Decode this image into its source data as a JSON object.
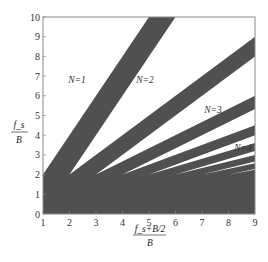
{
  "chart_data": {
    "type": "area",
    "title": "",
    "xlabel": "(f_s + B/2) / B",
    "xlabel_num": "f_s+B/2",
    "xlabel_den": "B",
    "ylabel": "f_s / B",
    "ylabel_num": "f_s",
    "ylabel_den": "B",
    "xlim": [
      1,
      9
    ],
    "ylim": [
      0,
      10
    ],
    "xticks": [
      "1",
      "2",
      "3",
      "4",
      "5",
      "6",
      "7",
      "8",
      "9"
    ],
    "yticks": [
      "0",
      "1",
      "2",
      "3",
      "4",
      "5",
      "6",
      "7",
      "8",
      "9",
      "10"
    ],
    "grid": false,
    "legend": "none",
    "zones": [
      {
        "N": 1,
        "label": "N=1",
        "apex": [
          1,
          2
        ],
        "lower_slope": 2.0,
        "upper": "none"
      },
      {
        "N": 2,
        "label": "N=2",
        "apex": [
          2,
          2
        ],
        "lower_slope": 1.0,
        "upper_slope": 2.0
      },
      {
        "N": 3,
        "label": "N=3",
        "apex": [
          3,
          2
        ],
        "lower_slope": 0.667,
        "upper_slope": 1.0
      },
      {
        "N": 4,
        "label": "N=4",
        "apex": [
          4,
          2
        ],
        "lower_slope": 0.5,
        "upper_slope": 0.667
      },
      {
        "N": 5,
        "label": "",
        "apex": [
          5,
          2
        ],
        "lower_slope": 0.4,
        "upper_slope": 0.5
      },
      {
        "N": 6,
        "label": "",
        "apex": [
          6,
          2
        ],
        "lower_slope": 0.333,
        "upper_slope": 0.4
      },
      {
        "N": 7,
        "label": "",
        "apex": [
          7,
          2
        ],
        "lower_slope": 0.286,
        "upper_slope": 0.333
      },
      {
        "N": 8,
        "label": "",
        "apex": [
          8,
          2
        ],
        "lower_slope": 0.25,
        "upper_slope": 0.286
      }
    ],
    "colors": {
      "forbidden": "#505050",
      "allowed": "#ffffff",
      "axis": "#888888"
    }
  }
}
